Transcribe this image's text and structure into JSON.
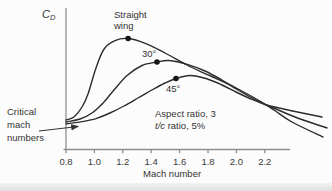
{
  "figure": {
    "background": "#fcfcfc",
    "curve_color": "#2c2c2c",
    "axis_color": "#8f8f8f",
    "text_color": "#333333"
  },
  "labels": {
    "cd_main": "C",
    "cd_sub": "D",
    "straight_line1": "Straight",
    "straight_line2": "wing",
    "sweep30": "30°",
    "sweep45": "45°",
    "critical_line1": "Critical",
    "critical_line2": "mach",
    "critical_line3": "numbers",
    "annotation_line1": "Aspect ratio, 3",
    "annotation_tc": "t/c",
    "annotation_line2_rest": " ratio, 5%",
    "xlabel": "Mach number"
  },
  "chart_data": {
    "type": "line",
    "title": "",
    "xlabel": "Mach number",
    "ylabel": "C_D",
    "x_ticks": [
      0.8,
      1.0,
      1.2,
      1.4,
      1.6,
      1.8,
      2.0,
      2.2
    ],
    "xlim": [
      0.8,
      2.65
    ],
    "ylim": [
      0,
      1
    ],
    "grid": false,
    "y_units": "relative drag coefficient (unlabeled axis)",
    "annotations": [
      "Aspect ratio, 3",
      "t/c ratio, 5%",
      "Critical mach numbers"
    ],
    "series": [
      {
        "name": "Straight wing",
        "marker": [
          1.237,
          0.929
        ],
        "points": [
          [
            0.8,
            0.25
          ],
          [
            0.856,
            0.275
          ],
          [
            0.913,
            0.358
          ],
          [
            0.955,
            0.467
          ],
          [
            1.011,
            0.683
          ],
          [
            1.068,
            0.842
          ],
          [
            1.145,
            0.912
          ],
          [
            1.237,
            0.929
          ],
          [
            1.363,
            0.887
          ],
          [
            1.504,
            0.804
          ],
          [
            1.652,
            0.708
          ],
          [
            1.779,
            0.637
          ],
          [
            1.898,
            0.575
          ],
          [
            2.025,
            0.5
          ],
          [
            2.152,
            0.417
          ],
          [
            2.265,
            0.333
          ],
          [
            2.391,
            0.233
          ],
          [
            2.61,
            0.108
          ]
        ]
      },
      {
        "name": "30° sweep",
        "marker": [
          1.441,
          0.733
        ],
        "points": [
          [
            0.8,
            0.233
          ],
          [
            0.899,
            0.258
          ],
          [
            0.983,
            0.308
          ],
          [
            1.061,
            0.392
          ],
          [
            1.138,
            0.5
          ],
          [
            1.23,
            0.621
          ],
          [
            1.335,
            0.704
          ],
          [
            1.441,
            0.733
          ],
          [
            1.525,
            0.746
          ],
          [
            1.659,
            0.712
          ],
          [
            1.779,
            0.658
          ],
          [
            1.898,
            0.583
          ],
          [
            2.011,
            0.5
          ],
          [
            2.124,
            0.425
          ],
          [
            2.222,
            0.371
          ],
          [
            2.413,
            0.275
          ],
          [
            2.638,
            0.183
          ]
        ]
      },
      {
        "name": "45° sweep",
        "marker": [
          1.575,
          0.596
        ],
        "points": [
          [
            0.8,
            0.217
          ],
          [
            0.913,
            0.237
          ],
          [
            1.011,
            0.262
          ],
          [
            1.11,
            0.308
          ],
          [
            1.208,
            0.367
          ],
          [
            1.307,
            0.433
          ],
          [
            1.405,
            0.5
          ],
          [
            1.497,
            0.558
          ],
          [
            1.575,
            0.596
          ],
          [
            1.673,
            0.621
          ],
          [
            1.786,
            0.596
          ],
          [
            1.891,
            0.546
          ],
          [
            1.997,
            0.483
          ],
          [
            2.103,
            0.425
          ],
          [
            2.201,
            0.379
          ],
          [
            2.3,
            0.35
          ],
          [
            2.413,
            0.321
          ],
          [
            2.603,
            0.275
          ]
        ]
      }
    ]
  }
}
